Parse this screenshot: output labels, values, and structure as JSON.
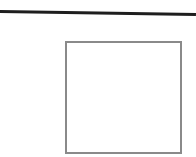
{
  "canvas": {
    "background": "#ffffff",
    "width": 196,
    "height": 157
  },
  "rule": {
    "color": "#1e1e1e"
  },
  "box": {
    "border_color": "#8a8a8a",
    "content": ""
  }
}
